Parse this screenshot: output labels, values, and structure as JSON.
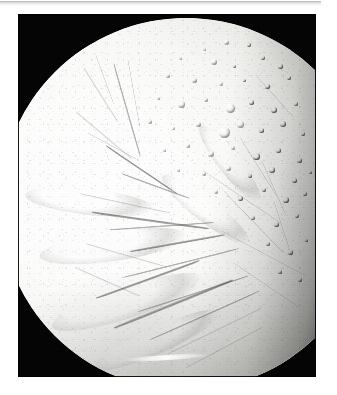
{
  "page": {
    "background_color": "#ffffff",
    "divider_color": "#c2c2c2"
  },
  "figure": {
    "frame": {
      "background_color": "#000000",
      "x": 18,
      "y": 14,
      "width": 298,
      "height": 363
    },
    "caption": "",
    "alt_text": "Grayscale spacecraft photograph of the icy moon Enceladus. The bright, sunlit crescent fills most of the frame, with the limb sweeping from the upper right around to the left edge and the terminator darkening along the right side.",
    "subject": {
      "name": "Enceladus",
      "body_type": "icy moon",
      "illumination": "sunlit from upper left, terminator on right",
      "surface_color_light": "#fefefe",
      "surface_color_mid": "#c9c9c6",
      "surface_color_shadow": "#1a1a1a"
    },
    "terrain_regions": [
      {
        "name": "northern cratered plains",
        "description": "densely cratered terrain in the upper and right portion of the disc",
        "crater_density": "high"
      },
      {
        "name": "central smooth plains",
        "description": "bright, nearly craterless grooved plains across the middle of the disc",
        "crater_density": "low"
      },
      {
        "name": "south polar terrain",
        "description": "parallel ridges and troughs near the lower limb",
        "crater_density": "very low"
      }
    ],
    "features": {
      "bright_limb_streak": "narrow bright lineament near the lower limb",
      "fracture_system": "branching network of troughs and ridges crossing the disc",
      "crater_clusters": "overlapping craters with raised rims right of centre"
    }
  },
  "moon_geometry": {
    "disc_left": -18,
    "disc_top": 4,
    "disc_diameter": 372,
    "limb_top_x": 200,
    "limb_left_x": 9
  },
  "craters": [
    {
      "x": 208,
      "y": 28,
      "d": 5,
      "style": "bright"
    },
    {
      "x": 186,
      "y": 35,
      "d": 3,
      "style": ""
    },
    {
      "x": 231,
      "y": 31,
      "d": 4,
      "style": "dim"
    },
    {
      "x": 162,
      "y": 44,
      "d": 3,
      "style": ""
    },
    {
      "x": 196,
      "y": 48,
      "d": 6,
      "style": "bright"
    },
    {
      "x": 216,
      "y": 52,
      "d": 3,
      "style": "dim"
    },
    {
      "x": 245,
      "y": 44,
      "d": 4,
      "style": "dim"
    },
    {
      "x": 262,
      "y": 52,
      "d": 5,
      "style": "dim"
    },
    {
      "x": 150,
      "y": 62,
      "d": 4,
      "style": ""
    },
    {
      "x": 176,
      "y": 66,
      "d": 5,
      "style": ""
    },
    {
      "x": 203,
      "y": 70,
      "d": 4,
      "style": "bright"
    },
    {
      "x": 226,
      "y": 66,
      "d": 3,
      "style": "dim"
    },
    {
      "x": 249,
      "y": 72,
      "d": 5,
      "style": "dim"
    },
    {
      "x": 271,
      "y": 64,
      "d": 4,
      "style": "dim"
    },
    {
      "x": 140,
      "y": 84,
      "d": 3,
      "style": ""
    },
    {
      "x": 163,
      "y": 90,
      "d": 7,
      "style": "bright"
    },
    {
      "x": 188,
      "y": 86,
      "d": 4,
      "style": ""
    },
    {
      "x": 212,
      "y": 94,
      "d": 9,
      "style": "bright"
    },
    {
      "x": 233,
      "y": 88,
      "d": 5,
      "style": "dim"
    },
    {
      "x": 256,
      "y": 96,
      "d": 6,
      "style": "dim"
    },
    {
      "x": 278,
      "y": 90,
      "d": 4,
      "style": "dim"
    },
    {
      "x": 132,
      "y": 108,
      "d": 4,
      "style": ""
    },
    {
      "x": 155,
      "y": 114,
      "d": 3,
      "style": ""
    },
    {
      "x": 180,
      "y": 110,
      "d": 5,
      "style": ""
    },
    {
      "x": 206,
      "y": 118,
      "d": 11,
      "style": "bright"
    },
    {
      "x": 222,
      "y": 110,
      "d": 7,
      "style": "bright"
    },
    {
      "x": 243,
      "y": 116,
      "d": 5,
      "style": "dim"
    },
    {
      "x": 265,
      "y": 110,
      "d": 6,
      "style": "dim"
    },
    {
      "x": 285,
      "y": 120,
      "d": 4,
      "style": "dim"
    },
    {
      "x": 146,
      "y": 136,
      "d": 3,
      "style": ""
    },
    {
      "x": 170,
      "y": 132,
      "d": 4,
      "style": ""
    },
    {
      "x": 193,
      "y": 140,
      "d": 6,
      "style": "bright"
    },
    {
      "x": 215,
      "y": 134,
      "d": 4,
      "style": ""
    },
    {
      "x": 238,
      "y": 142,
      "d": 7,
      "style": "dim"
    },
    {
      "x": 260,
      "y": 136,
      "d": 5,
      "style": "dim"
    },
    {
      "x": 281,
      "y": 146,
      "d": 5,
      "style": "dim"
    },
    {
      "x": 160,
      "y": 156,
      "d": 3,
      "style": ""
    },
    {
      "x": 186,
      "y": 160,
      "d": 4,
      "style": ""
    },
    {
      "x": 210,
      "y": 154,
      "d": 5,
      "style": "bright"
    },
    {
      "x": 232,
      "y": 162,
      "d": 4,
      "style": "dim"
    },
    {
      "x": 254,
      "y": 156,
      "d": 6,
      "style": "dim"
    },
    {
      "x": 276,
      "y": 166,
      "d": 5,
      "style": "dim"
    },
    {
      "x": 292,
      "y": 158,
      "d": 3,
      "style": "dim"
    },
    {
      "x": 198,
      "y": 178,
      "d": 4,
      "style": ""
    },
    {
      "x": 222,
      "y": 184,
      "d": 5,
      "style": "dim"
    },
    {
      "x": 246,
      "y": 176,
      "d": 4,
      "style": "dim"
    },
    {
      "x": 268,
      "y": 186,
      "d": 6,
      "style": "dim"
    },
    {
      "x": 287,
      "y": 180,
      "d": 4,
      "style": "dim"
    },
    {
      "x": 235,
      "y": 204,
      "d": 4,
      "style": "dim"
    },
    {
      "x": 258,
      "y": 210,
      "d": 5,
      "style": "dim"
    },
    {
      "x": 279,
      "y": 202,
      "d": 4,
      "style": "dim"
    },
    {
      "x": 250,
      "y": 230,
      "d": 4,
      "style": "dim"
    },
    {
      "x": 272,
      "y": 238,
      "d": 5,
      "style": "dim"
    },
    {
      "x": 288,
      "y": 226,
      "d": 3,
      "style": "dim"
    },
    {
      "x": 262,
      "y": 258,
      "d": 4,
      "style": "dim"
    },
    {
      "x": 282,
      "y": 266,
      "d": 4,
      "style": "dim"
    }
  ],
  "cracks": [
    {
      "x": 66,
      "y": 52,
      "w": 64,
      "h": 3,
      "rot": 58,
      "style": "soft"
    },
    {
      "x": 78,
      "y": 40,
      "w": 52,
      "h": 2,
      "rot": 70,
      "style": "soft"
    },
    {
      "x": 96,
      "y": 48,
      "w": 96,
      "h": 3,
      "rot": 74,
      "style": ""
    },
    {
      "x": 110,
      "y": 44,
      "w": 70,
      "h": 2,
      "rot": 80,
      "style": "soft"
    },
    {
      "x": 58,
      "y": 96,
      "w": 74,
      "h": 3,
      "rot": 40,
      "style": "soft"
    },
    {
      "x": 70,
      "y": 118,
      "w": 58,
      "h": 2,
      "rot": 28,
      "style": "soft"
    },
    {
      "x": 88,
      "y": 130,
      "w": 86,
      "h": 3,
      "rot": 34,
      "style": "strong"
    },
    {
      "x": 104,
      "y": 158,
      "w": 72,
      "h": 3,
      "rot": 20,
      "style": ""
    },
    {
      "x": 62,
      "y": 178,
      "w": 92,
      "h": 3,
      "rot": 12,
      "style": "soft"
    },
    {
      "x": 74,
      "y": 196,
      "w": 118,
      "h": 4,
      "rot": 8,
      "style": "strong"
    },
    {
      "x": 92,
      "y": 214,
      "w": 104,
      "h": 3,
      "rot": -4,
      "style": ""
    },
    {
      "x": 68,
      "y": 228,
      "w": 84,
      "h": 3,
      "rot": 16,
      "style": "soft"
    },
    {
      "x": 112,
      "y": 236,
      "w": 96,
      "h": 3,
      "rot": -10,
      "style": "dark"
    },
    {
      "x": 58,
      "y": 252,
      "w": 70,
      "h": 3,
      "rot": 24,
      "style": "soft"
    },
    {
      "x": 104,
      "y": 262,
      "w": 120,
      "h": 3,
      "rot": -14,
      "style": ""
    },
    {
      "x": 78,
      "y": 282,
      "w": 110,
      "h": 4,
      "rot": -20,
      "style": "strong"
    },
    {
      "x": 120,
      "y": 296,
      "w": 116,
      "h": 3,
      "rot": -18,
      "style": ""
    },
    {
      "x": 96,
      "y": 312,
      "w": 128,
      "h": 4,
      "rot": -22,
      "style": "dark"
    },
    {
      "x": 132,
      "y": 324,
      "w": 120,
      "h": 3,
      "rot": -24,
      "style": ""
    },
    {
      "x": 150,
      "y": 338,
      "w": 104,
      "h": 3,
      "rot": -26,
      "style": "soft"
    },
    {
      "x": 168,
      "y": 352,
      "w": 86,
      "h": 3,
      "rot": -28,
      "style": "soft"
    },
    {
      "x": 186,
      "y": 156,
      "w": 94,
      "h": 2,
      "rot": 34,
      "style": "soft"
    },
    {
      "x": 206,
      "y": 176,
      "w": 86,
      "h": 2,
      "rot": 46,
      "style": "soft"
    },
    {
      "x": 222,
      "y": 122,
      "w": 70,
      "h": 2,
      "rot": 58,
      "style": "soft"
    },
    {
      "x": 244,
      "y": 146,
      "w": 60,
      "h": 2,
      "rot": 66,
      "style": "soft"
    },
    {
      "x": 238,
      "y": 60,
      "w": 56,
      "h": 2,
      "rot": 48,
      "style": "soft"
    },
    {
      "x": 256,
      "y": 186,
      "w": 58,
      "h": 2,
      "rot": 72,
      "style": "soft"
    },
    {
      "x": 204,
      "y": 216,
      "w": 96,
      "h": 2,
      "rot": 28,
      "style": "soft"
    },
    {
      "x": 216,
      "y": 248,
      "w": 80,
      "h": 2,
      "rot": 34,
      "style": "soft"
    }
  ],
  "ridges": [
    {
      "x": 72,
      "y": 188,
      "w": 130,
      "h": 26,
      "rot": 6
    },
    {
      "x": 96,
      "y": 232,
      "w": 150,
      "h": 30,
      "rot": -8
    },
    {
      "x": 110,
      "y": 288,
      "w": 160,
      "h": 32,
      "rot": -18
    },
    {
      "x": 140,
      "y": 326,
      "w": 140,
      "h": 26,
      "rot": -24
    },
    {
      "x": 188,
      "y": 196,
      "w": 110,
      "h": 24,
      "rot": 38
    },
    {
      "x": 212,
      "y": 150,
      "w": 96,
      "h": 22,
      "rot": 52
    }
  ]
}
